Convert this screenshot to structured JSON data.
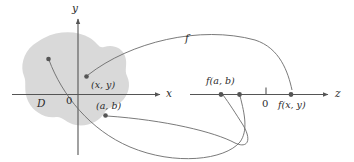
{
  "figure": {
    "kind": "function-mapping-diagram",
    "colors": {
      "region_fill": "#d9d9d9",
      "axis": "#555555",
      "curve": "#666666",
      "dot": "#555555",
      "text": "#2b2b2b",
      "background": "#ffffff"
    },
    "domain_plane": {
      "region_label": "D",
      "origin_label": "0",
      "y_axis_label": "y",
      "x_axis_label": "x",
      "points": [
        {
          "name": "point-xy",
          "label": "(x, y)"
        },
        {
          "name": "point-ab",
          "label": "(a, b)"
        },
        {
          "name": "point-unlabeled",
          "label": ""
        }
      ]
    },
    "mapping": {
      "function_label": "f",
      "arrow_count": 3
    },
    "range_line": {
      "axis_label": "z",
      "origin_label": "0",
      "values": [
        {
          "name": "value-f-ab",
          "label": "f(a, b)"
        },
        {
          "name": "value-f-unlabeled",
          "label": ""
        },
        {
          "name": "value-f-xy",
          "label": "f(x, y)"
        }
      ]
    }
  }
}
